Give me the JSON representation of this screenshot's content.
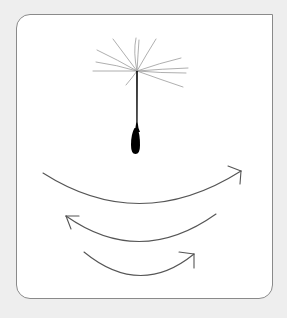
{
  "illustration": {
    "subject": "dandelion-seed",
    "background_color": "#eeeeee",
    "panel_color": "#ffffff",
    "border_color": "#8a8a8a",
    "pappus_color": "#9a9a9a",
    "seed_color": "#000000",
    "arrow_color": "#555555",
    "arrows": [
      {
        "id": "arrow-1",
        "direction": "right"
      },
      {
        "id": "arrow-2",
        "direction": "left"
      },
      {
        "id": "arrow-3",
        "direction": "right"
      }
    ]
  }
}
